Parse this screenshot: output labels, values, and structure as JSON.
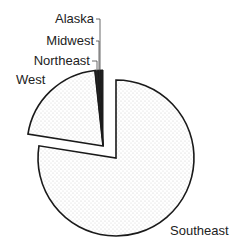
{
  "chart_data": {
    "type": "pie",
    "title": "",
    "categories": [
      "Southeast",
      "West",
      "Northeast",
      "Midwest",
      "Alaska"
    ],
    "values": [
      77.5,
      20.8,
      0.7,
      0.5,
      0.5
    ],
    "unit": "percent (estimated from slice angles)",
    "exploded": [
      "West",
      "Northeast",
      "Midwest",
      "Alaska"
    ],
    "start_angle_deg": 0,
    "direction": "clockwise",
    "fill": "light gray dot pattern",
    "legend": "none (direct labels)",
    "labels": [
      {
        "text": "Southeast",
        "position": "bottom-right"
      },
      {
        "text": "West",
        "position": "upper-left"
      },
      {
        "text": "Northeast",
        "position": "top, leader line"
      },
      {
        "text": "Midwest",
        "position": "top, leader line"
      },
      {
        "text": "Alaska",
        "position": "top, leader line"
      }
    ]
  },
  "colors": {
    "outline": "#1a1a1a",
    "fill": "#ffffff",
    "dots": "#c8c8c8",
    "text": "#222222"
  }
}
